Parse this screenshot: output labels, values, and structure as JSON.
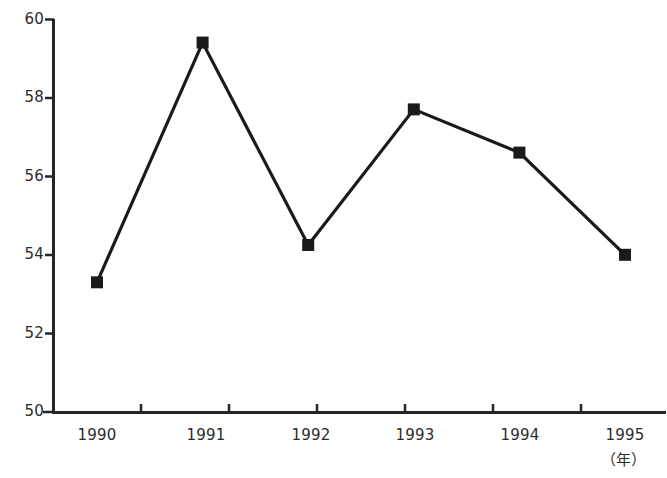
{
  "chart_data": {
    "type": "line",
    "title": "",
    "subtitle": "",
    "xlabel": "（年）",
    "ylabel": "",
    "categories": [
      "1990",
      "1991",
      "1992",
      "1993",
      "1994",
      "1995"
    ],
    "values": [
      53.3,
      59.4,
      54.25,
      57.7,
      56.6,
      54.0
    ],
    "series": [
      {
        "name": "",
        "values": [
          53.3,
          59.4,
          54.25,
          57.7,
          56.6,
          54.0
        ]
      }
    ],
    "x": [
      "1990",
      "1991",
      "1992",
      "1993",
      "1994",
      "1995"
    ],
    "ylim": [
      50,
      60
    ],
    "yticks": [
      50,
      52,
      54,
      56,
      58,
      60
    ],
    "ytick_labels": [
      "50",
      "52",
      "54",
      "56",
      "58",
      "60"
    ],
    "xtick_labels": [
      "1990",
      "1991",
      "1992",
      "1993",
      "1994",
      "1995"
    ],
    "grid": false,
    "legend": null,
    "legend_position": "none",
    "marker": "square",
    "annotations": [],
    "colors": {
      "line": "#1a1a1a",
      "marker": "#1a1a1a",
      "axis": "#262626",
      "background": "#ffffff",
      "text": "#2b2b2b"
    }
  },
  "axes": {
    "y_tick_labels": [
      "60",
      "58",
      "56",
      "54",
      "52",
      "50"
    ],
    "x_tick_labels": [
      "1990",
      "1991",
      "1992",
      "1993",
      "1994",
      "1995"
    ],
    "x_unit_label": "（年）"
  },
  "footer": {
    "source_note": ""
  }
}
